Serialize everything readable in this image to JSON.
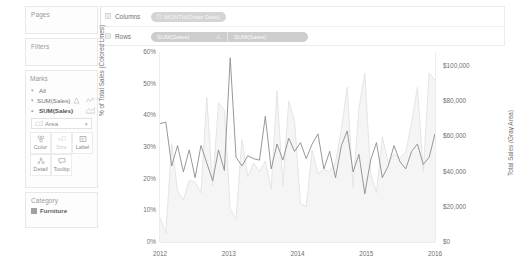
{
  "sidebar": {
    "pages": {
      "title": "Pages"
    },
    "filters": {
      "title": "Filters"
    },
    "marks": {
      "title": "Marks",
      "rows": [
        {
          "label": "All",
          "icon": "caret-down-icon",
          "type_icon": ""
        },
        {
          "label": "SUM(Sales)",
          "icon": "caret-down-icon",
          "type_icon": "line-icon",
          "extra_icon": "triangle-icon"
        },
        {
          "label": "SUM(Sales)",
          "icon": "caret-up-icon",
          "type_icon": "area-icon",
          "extra_icon": ""
        }
      ],
      "mark_type": "Area",
      "buttons": [
        {
          "label": "Color",
          "icon": "color-icon",
          "disabled": false
        },
        {
          "label": "Size",
          "icon": "size-icon",
          "disabled": true
        },
        {
          "label": "Label",
          "icon": "label-icon",
          "disabled": false
        },
        {
          "label": "Detail",
          "icon": "detail-icon",
          "disabled": false
        },
        {
          "label": "Tooltip",
          "icon": "tooltip-icon",
          "disabled": false
        }
      ]
    },
    "legend": {
      "title": "Category",
      "items": [
        {
          "label": "Furniture",
          "color": "#9fa0a2"
        }
      ]
    }
  },
  "shelves": {
    "columns": {
      "label": "Columns",
      "icon": "columns-icon",
      "pills": [
        {
          "text": "MONTH(Order Date)",
          "icon": "calendar-icon"
        }
      ]
    },
    "rows": {
      "label": "Rows",
      "icon": "rows-icon",
      "pills": [
        {
          "text": "SUM(Sales)",
          "icon": ""
        },
        {
          "text": "SUM(Sales)",
          "icon": ""
        }
      ]
    }
  },
  "chart_data": {
    "type": "line",
    "title": "",
    "xlabel": "",
    "ylabel": "% of Total Sales (Colored Lines)",
    "y2label": "Total Sales (Gray Area)",
    "xticks": [
      "2012",
      "2013",
      "2014",
      "2015",
      "2016"
    ],
    "yticks_left": [
      "0%",
      "10%",
      "20%",
      "30%",
      "40%",
      "50%",
      "60%"
    ],
    "yticks_right": [
      "$0",
      "$20,000",
      "$40,000",
      "$60,000",
      "$80,000",
      "$100,000"
    ],
    "ylim_left": [
      0,
      65
    ],
    "ylim_right": [
      0,
      108000
    ],
    "grid": false,
    "legend_position": "right-sidebar",
    "x": [
      "2012-01",
      "2012-02",
      "2012-03",
      "2012-04",
      "2012-05",
      "2012-06",
      "2012-07",
      "2012-08",
      "2012-09",
      "2012-10",
      "2012-11",
      "2012-12",
      "2013-01",
      "2013-02",
      "2013-03",
      "2013-04",
      "2013-05",
      "2013-06",
      "2013-07",
      "2013-08",
      "2013-09",
      "2013-10",
      "2013-11",
      "2013-12",
      "2014-01",
      "2014-02",
      "2014-03",
      "2014-04",
      "2014-05",
      "2014-06",
      "2014-07",
      "2014-08",
      "2014-09",
      "2014-10",
      "2014-11",
      "2014-12",
      "2015-01",
      "2015-02",
      "2015-03",
      "2015-04",
      "2015-05",
      "2015-06",
      "2015-07",
      "2015-08",
      "2015-09",
      "2015-10",
      "2015-11",
      "2015-12"
    ],
    "series": [
      {
        "name": "% of Total Sales (Furniture)",
        "color": "#8c8c8c",
        "axis": "left",
        "unit": "%",
        "values": [
          40.5,
          41.0,
          26.0,
          33.0,
          24.0,
          31.5,
          22.0,
          33.0,
          27.0,
          21.0,
          31.5,
          24.5,
          63.0,
          29.0,
          26.0,
          29.5,
          28.5,
          28.0,
          43.0,
          25.0,
          33.5,
          28.0,
          35.5,
          31.0,
          34.0,
          28.5,
          33.5,
          37.0,
          25.0,
          31.0,
          22.0,
          33.0,
          38.0,
          24.0,
          30.0,
          16.5,
          28.0,
          34.0,
          22.0,
          26.0,
          33.0,
          27.5,
          25.0,
          31.0,
          33.5,
          26.5,
          29.0,
          37.0
        ]
      },
      {
        "name": "Total Sales (Gray Area)",
        "color": "#e2e2e2",
        "axis": "right",
        "unit": "$",
        "values": [
          14000,
          5000,
          56000,
          29000,
          24000,
          35000,
          34000,
          28000,
          82000,
          32000,
          79000,
          75000,
          19000,
          13000,
          58000,
          37000,
          45000,
          40000,
          46000,
          30000,
          86000,
          32000,
          80000,
          69000,
          22000,
          20000,
          52000,
          39000,
          41000,
          40000,
          45000,
          64000,
          88000,
          31000,
          76000,
          96000,
          39000,
          28000,
          60000,
          45000,
          50000,
          48000,
          51000,
          68000,
          88000,
          40000,
          96000,
          92000
        ]
      }
    ]
  }
}
